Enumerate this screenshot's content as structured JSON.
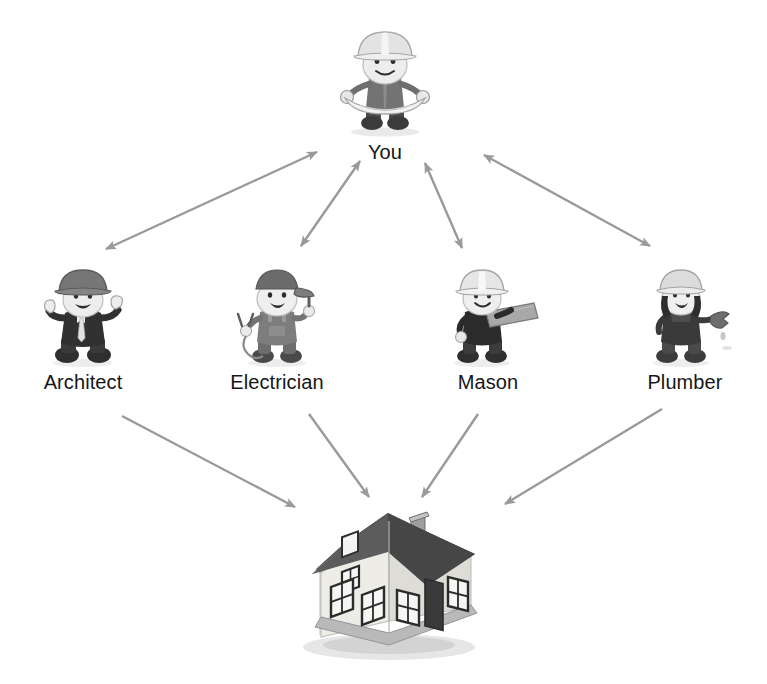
{
  "diagram": {
    "type": "relationship-diagram",
    "title": "",
    "background_color": "#ffffff",
    "edge_color": "#9a9a9a",
    "label_color": "#161616",
    "nodes": [
      {
        "id": "you",
        "label": "You",
        "icon": "hardhat-worker-with-blueprint",
        "role": "central",
        "x": 385,
        "y": 88
      },
      {
        "id": "architect",
        "label": "Architect",
        "icon": "hardhat-worker-in-suit-thumbs-up",
        "role": "contractor",
        "x": 83,
        "y": 322
      },
      {
        "id": "electrician",
        "label": "Electrician",
        "icon": "worker-with-cap-and-pliers",
        "role": "contractor",
        "x": 277,
        "y": 322
      },
      {
        "id": "mason",
        "label": "Mason",
        "icon": "hardhat-worker-carrying-plank",
        "role": "contractor",
        "x": 488,
        "y": 322
      },
      {
        "id": "plumber",
        "label": "Plumber",
        "icon": "hardhat-worker-with-wrench",
        "role": "contractor",
        "x": 685,
        "y": 322
      },
      {
        "id": "house",
        "label": "",
        "icon": "house-with-chimney",
        "role": "outcome",
        "x": 388,
        "y": 575
      }
    ],
    "edges": [
      {
        "from": "you",
        "to": "architect",
        "direction": "both",
        "x1": 317,
        "y1": 152,
        "x2": 106,
        "y2": 249
      },
      {
        "from": "you",
        "to": "electrician",
        "direction": "both",
        "x1": 360,
        "y1": 161,
        "x2": 301,
        "y2": 246
      },
      {
        "from": "you",
        "to": "mason",
        "direction": "both",
        "x1": 425,
        "y1": 163,
        "x2": 462,
        "y2": 248
      },
      {
        "from": "you",
        "to": "plumber",
        "direction": "both",
        "x1": 484,
        "y1": 155,
        "x2": 650,
        "y2": 246
      },
      {
        "from": "architect",
        "to": "house",
        "direction": "to",
        "x1": 122,
        "y1": 416,
        "x2": 295,
        "y2": 507
      },
      {
        "from": "electrician",
        "to": "house",
        "direction": "to",
        "x1": 309,
        "y1": 414,
        "x2": 369,
        "y2": 497
      },
      {
        "from": "mason",
        "to": "house",
        "direction": "to",
        "x1": 478,
        "y1": 414,
        "x2": 422,
        "y2": 497
      },
      {
        "from": "plumber",
        "to": "house",
        "direction": "to",
        "x1": 662,
        "y1": 409,
        "x2": 505,
        "y2": 504
      }
    ]
  }
}
